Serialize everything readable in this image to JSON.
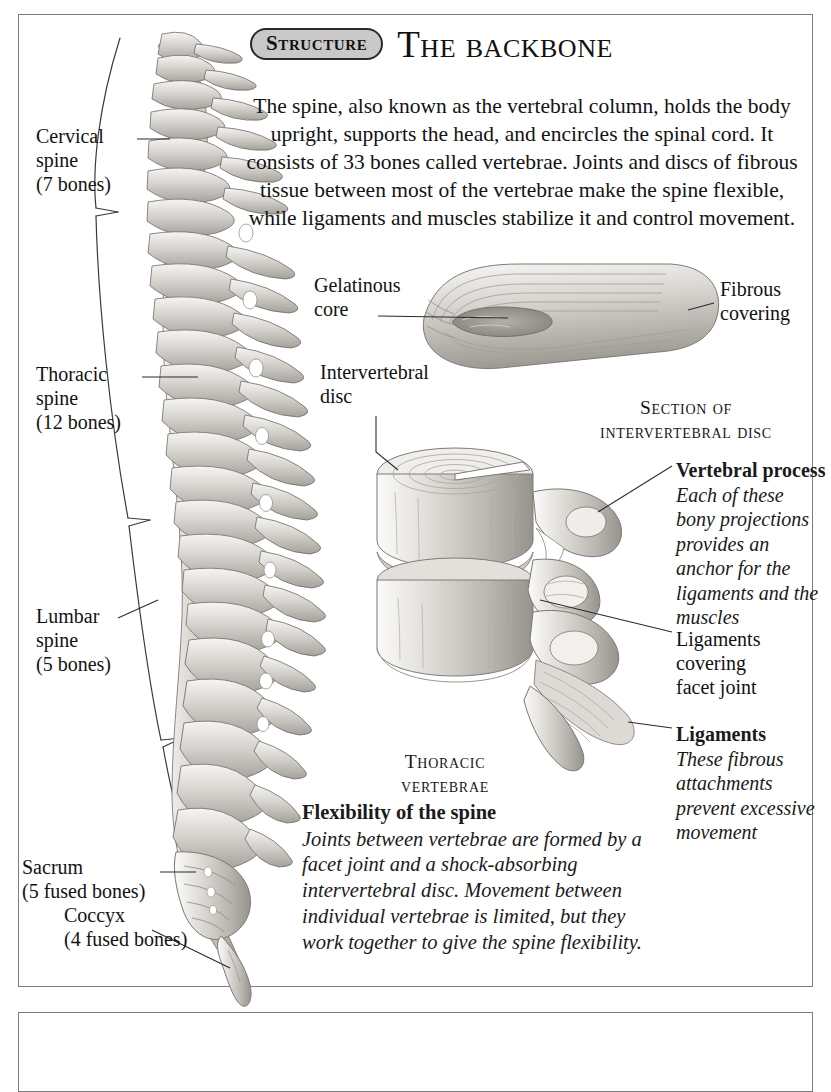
{
  "header": {
    "badge": "Structure",
    "title": "The backbone"
  },
  "intro": "The spine, also known as the vertebral column, holds the body upright, supports the head, and encircles the spinal cord. It consists of 33 bones called vertebrae. Joints and discs of fibrous tissue between most of the vertebrae make the spine flexible, while ligaments and muscles stabilize it and control movement.",
  "spine_labels": {
    "cervical": {
      "line1": "Cervical",
      "line2": "spine",
      "line3": "(7 bones)"
    },
    "thoracic": {
      "line1": "Thoracic",
      "line2": "spine",
      "line3": "(12 bones)"
    },
    "lumbar": {
      "line1": "Lumbar",
      "line2": "spine",
      "line3": "(5 bones)"
    },
    "sacrum": {
      "line1": "Sacrum",
      "line2": "(5 fused bones)"
    },
    "coccyx": {
      "line1": "Coccyx",
      "line2": "(4 fused bones)"
    }
  },
  "disc_diagram": {
    "gelatinous_core": {
      "line1": "Gelatinous",
      "line2": "core"
    },
    "fibrous_covering": {
      "line1": "Fibrous",
      "line2": "covering"
    },
    "caption": {
      "line1": "Section of",
      "line2": "intervertebral disc"
    }
  },
  "vertebrae_diagram": {
    "intervertebral_disc": {
      "line1": "Intervertebral",
      "line2": "disc"
    },
    "caption": {
      "line1": "Thoracic",
      "line2": "vertebrae"
    },
    "vertebral_process": {
      "title": "Vertebral process",
      "body": "Each of these bony projections provides an anchor for the ligaments and the muscles"
    },
    "ligaments_facet": {
      "line1": "Ligaments",
      "line2": "covering",
      "line3": "facet joint"
    },
    "ligaments_fibrous": {
      "title": "Ligaments",
      "body": "These fibrous attachments prevent excessive movement"
    }
  },
  "flexibility": {
    "title": "Flexibility of the spine",
    "body": "Joints between vertebrae are formed by a facet joint and a shock-absorbing intervertebral disc. Movement between individual vertebrae is limited, but they work together to give the spine flexibility."
  },
  "colors": {
    "border": "#7d7d7d",
    "badge_fill": "#c9c9c9",
    "text": "#121212",
    "bone_light": "#e9e7e4",
    "bone_mid": "#c5c2bd",
    "bone_dark": "#9b9792"
  }
}
